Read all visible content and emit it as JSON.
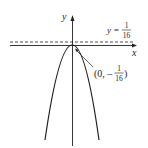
{
  "figure": {
    "axes": {
      "x_label": "x",
      "y_label": "y"
    },
    "directrix": {
      "label_lhs": "y =",
      "label_num": "1",
      "label_den": "16"
    },
    "vertex": {
      "label_open": "(0, –",
      "label_num": "1",
      "label_den": "16",
      "label_close": ")"
    },
    "curve": "downward-opening parabola with vertex at (0, -1/16)",
    "colors": {
      "stroke": "#231f20",
      "background": "#ffffff"
    }
  }
}
